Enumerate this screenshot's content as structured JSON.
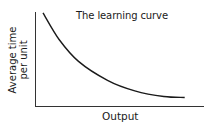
{
  "chart_data": {
    "type": "line",
    "title": "The learning curve",
    "xlabel": "Output",
    "ylabel": "Average time per unit",
    "ylabel_lines": [
      "Average time",
      "per unit"
    ],
    "xlim": [
      0,
      100
    ],
    "ylim": [
      0,
      100
    ],
    "grid": false,
    "legend": null,
    "ticks": {
      "x": [],
      "y": []
    },
    "series": [
      {
        "name": "Learning curve",
        "x": [
          5,
          15,
          27,
          45,
          62,
          80,
          93
        ],
        "y": [
          98,
          70,
          47,
          27,
          16,
          10,
          9
        ]
      }
    ],
    "colors": {
      "line": "#1a1a1a",
      "axis": "#333333",
      "text": "#1a1a1a",
      "background": "#ffffff"
    }
  }
}
